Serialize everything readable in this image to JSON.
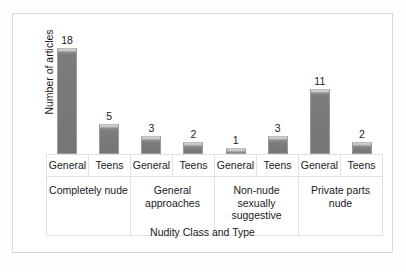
{
  "chart_data": {
    "type": "bar",
    "title": "",
    "xlabel": "Nudity Class and Type",
    "ylabel": "Number of articles",
    "grid": false,
    "legend": null,
    "ylim": [
      0,
      20
    ],
    "categories": [
      "Completely nude - General",
      "Completely nude - Teens",
      "General approaches - General",
      "General approaches - Teens",
      "Non-nude sexually suggestive - General",
      "Non-nude sexually suggestive - Teens",
      "Private parts nude - General",
      "Private parts nude - Teens"
    ],
    "values": [
      18,
      5,
      3,
      2,
      1,
      3,
      11,
      2
    ],
    "bars": [
      {
        "type": "General",
        "value": 18,
        "value_label": "18"
      },
      {
        "type": "Teens",
        "value": 5,
        "value_label": "5"
      },
      {
        "type": "General",
        "value": 3,
        "value_label": "3"
      },
      {
        "type": "Teens",
        "value": 2,
        "value_label": "2"
      },
      {
        "type": "General",
        "value": 1,
        "value_label": "1"
      },
      {
        "type": "Teens",
        "value": 3,
        "value_label": "3"
      },
      {
        "type": "General",
        "value": 11,
        "value_label": "11"
      },
      {
        "type": "Teens",
        "value": 2,
        "value_label": "2"
      }
    ],
    "groups": [
      {
        "class": "Completely nude",
        "types": [
          "General",
          "Teens"
        ]
      },
      {
        "class": "General approaches",
        "types": [
          "General",
          "Teens"
        ]
      },
      {
        "class": "Non-nude sexually suggestive",
        "types": [
          "General",
          "Teens"
        ]
      },
      {
        "class": "Private parts nude",
        "types": [
          "General",
          "Teens"
        ]
      }
    ],
    "colors": {
      "bar_fill": "#757575",
      "bar_highlight": "#d2d2d2",
      "bar_border": "#9a9a9a",
      "frame_border": "#d9d9d9",
      "table_border": "#e2e2e2",
      "text": "#1a1a1a",
      "background": "#ffffff"
    }
  }
}
